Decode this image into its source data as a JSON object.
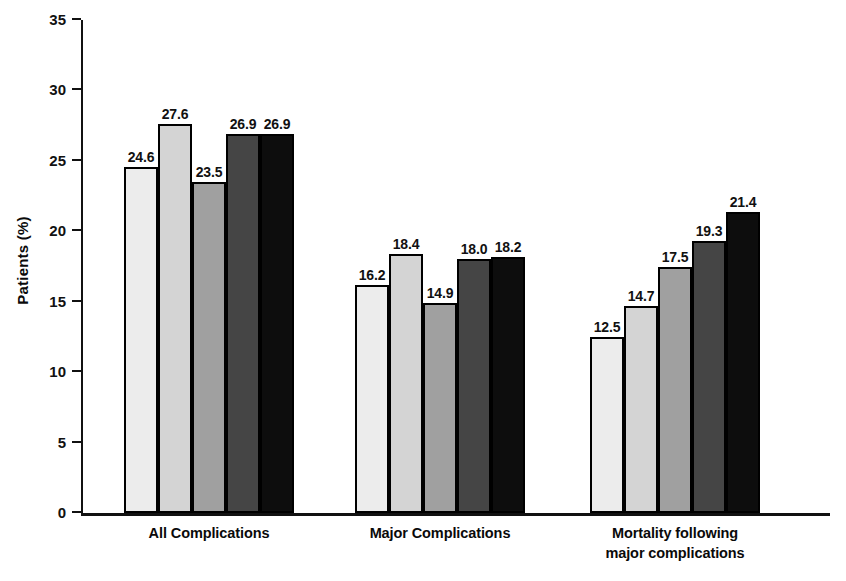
{
  "chart_data": {
    "type": "bar",
    "title": "",
    "xlabel": "",
    "ylabel": "Patients (%)",
    "ylim": [
      0,
      35
    ],
    "yticks": [
      0,
      5,
      10,
      15,
      20,
      25,
      30,
      35
    ],
    "ytick_labels": [
      "0",
      "5",
      "10",
      "15",
      "20",
      "25",
      "30",
      "35"
    ],
    "grid": false,
    "legend": "none",
    "categories": [
      "All Complications",
      "Major Complications",
      "Mortality following major complications"
    ],
    "category_lines": [
      [
        "All Complications"
      ],
      [
        "Major Complications"
      ],
      [
        "Mortality following",
        "major complications"
      ]
    ],
    "series": [
      {
        "name": "Series 1",
        "color": "#ececec",
        "values": [
          24.6,
          16.2,
          12.5
        ]
      },
      {
        "name": "Series 2",
        "color": "#d4d4d4",
        "values": [
          27.6,
          18.4,
          14.7
        ]
      },
      {
        "name": "Series 3",
        "color": "#a0a0a0",
        "values": [
          23.5,
          14.9,
          17.5
        ]
      },
      {
        "name": "Series 4",
        "color": "#454545",
        "values": [
          26.9,
          18.0,
          19.3
        ]
      },
      {
        "name": "Series 5",
        "color": "#0d0d0d",
        "values": [
          26.9,
          18.2,
          21.4
        ]
      }
    ],
    "bar_labels": [
      [
        "24.6",
        "27.6",
        "23.5",
        "26.9",
        "26.9"
      ],
      [
        "16.2",
        "18.4",
        "14.9",
        "18.0",
        "18.2"
      ],
      [
        "12.5",
        "14.7",
        "17.5",
        "19.3",
        "21.4"
      ]
    ],
    "axis_color": "#111111",
    "bar_border_color": "#000000",
    "background_color": "#ffffff"
  }
}
